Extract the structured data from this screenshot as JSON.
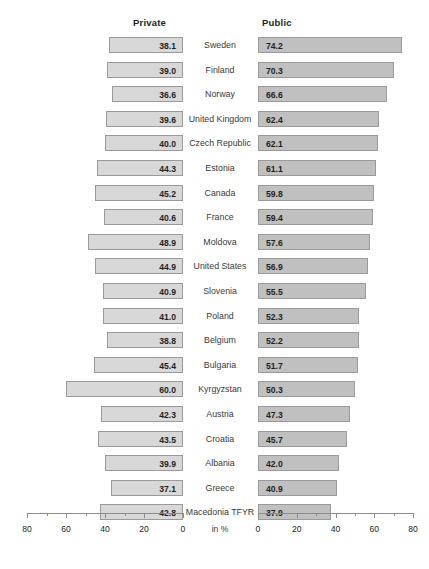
{
  "chart_data": {
    "type": "bar",
    "subtype": "diverging-paired-horizontal-bar",
    "title": "",
    "xlabel": "in %",
    "ylabel": "",
    "categories": [
      "Sweden",
      "Finland",
      "Norway",
      "United Kingdom",
      "Czech Republic",
      "Estonia",
      "Canada",
      "France",
      "Moldova",
      "United States",
      "Slovenia",
      "Poland",
      "Belgium",
      "Bulgaria",
      "Kyrgyzstan",
      "Austria",
      "Croatia",
      "Albania",
      "Greece",
      "Macedonia TFYR"
    ],
    "series": [
      {
        "name": "Private",
        "direction": "left",
        "color": "#d8d8d8",
        "values": [
          38.1,
          39.0,
          36.6,
          39.6,
          40.0,
          44.3,
          45.2,
          40.6,
          48.9,
          44.9,
          40.9,
          41.0,
          38.8,
          45.4,
          60.0,
          42.3,
          43.5,
          39.9,
          37.1,
          42.8
        ],
        "labels": [
          "38.1",
          "39.0",
          "36.6",
          "39.6",
          "40.0",
          "44.3",
          "45.2",
          "40.6",
          "48.9",
          "44.9",
          "40.9",
          "41.0",
          "38.8",
          "45.4",
          "60.0",
          "42.3",
          "43.5",
          "39.9",
          "37.1",
          "42.8"
        ]
      },
      {
        "name": "Public",
        "direction": "right",
        "color": "#c0c0c0",
        "values": [
          74.2,
          70.3,
          66.6,
          62.4,
          62.1,
          61.1,
          59.8,
          59.4,
          57.6,
          56.9,
          55.5,
          52.3,
          52.2,
          51.7,
          50.3,
          47.3,
          45.7,
          42.0,
          40.9,
          37.9
        ],
        "labels": [
          "74.2",
          "70.3",
          "66.6",
          "62.4",
          "62.1",
          "61.1",
          "59.8",
          "59.4",
          "57.6",
          "56.9",
          "55.5",
          "52.3",
          "52.2",
          "51.7",
          "50.3",
          "47.3",
          "45.7",
          "42.0",
          "40.9",
          "37.9"
        ]
      }
    ],
    "axis_left": {
      "range": [
        80,
        0
      ],
      "reversed": true,
      "ticks": [
        80,
        60,
        40,
        20,
        0
      ],
      "minor_ticks": [
        70,
        50,
        30,
        10
      ],
      "tick_labels": [
        "80",
        "60",
        "40",
        "20",
        "0"
      ]
    },
    "axis_right": {
      "range": [
        0,
        80
      ],
      "reversed": false,
      "ticks": [
        0,
        20,
        40,
        60,
        80
      ],
      "minor_ticks": [
        10,
        30,
        50,
        70
      ],
      "tick_labels": [
        "0",
        "20",
        "40",
        "60",
        "80"
      ]
    },
    "grid": false,
    "legend_position": "top-column-headers"
  },
  "headers": {
    "private": "Private",
    "public": "Public"
  },
  "axis": {
    "unit_label": "in %"
  }
}
